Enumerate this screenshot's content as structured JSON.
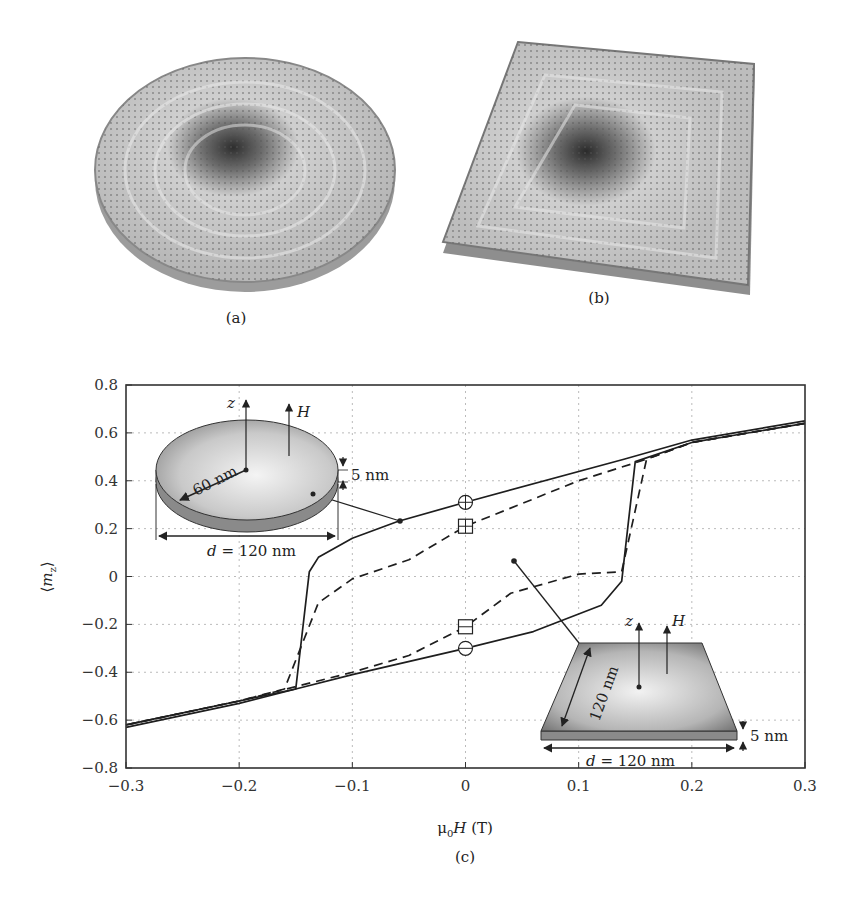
{
  "figure": {
    "panels": [
      {
        "id": "a",
        "label": "(a)",
        "description": "3D vortex magnetization arrows on a circular disk"
      },
      {
        "id": "b",
        "label": "(b)",
        "description": "3D vortex magnetization arrows on a square platelet"
      },
      {
        "id": "c",
        "label": "(c)",
        "description": "Hysteresis loops of <m_z> vs applied field"
      }
    ]
  },
  "chart_data": {
    "type": "line",
    "title": "",
    "panel_label": "(c)",
    "xlabel": "μ0H (T)",
    "ylabel": "⟨m_z⟩",
    "xlim": [
      -0.3,
      0.3
    ],
    "ylim": [
      -0.8,
      0.8
    ],
    "xticks": [
      -0.3,
      -0.2,
      -0.1,
      0,
      0.1,
      0.2,
      0.3
    ],
    "xtick_labels": [
      "−0.3",
      "−0.2",
      "−0.1",
      "0",
      "0.1",
      "0.2",
      "0.3"
    ],
    "yticks": [
      -0.8,
      -0.6,
      -0.4,
      -0.2,
      0,
      0.2,
      0.4,
      0.6,
      0.8
    ],
    "ytick_labels": [
      "−0.8",
      "−0.6",
      "−0.4",
      "−0.2",
      "0",
      "0.2",
      "0.4",
      "0.6",
      "0.8"
    ],
    "grid": true,
    "legend": null,
    "series": [
      {
        "name": "disk (solid)",
        "style": "solid",
        "descending_branch": {
          "x": [
            0.3,
            0.2,
            0.14,
            0.0,
            -0.06,
            -0.1,
            -0.13,
            -0.138,
            -0.15,
            -0.2,
            -0.3
          ],
          "y": [
            0.65,
            0.57,
            0.49,
            0.31,
            0.23,
            0.16,
            0.08,
            0.02,
            -0.47,
            -0.53,
            -0.63
          ]
        },
        "ascending_branch": {
          "x": [
            -0.3,
            -0.2,
            -0.15,
            -0.1,
            0.0,
            0.06,
            0.12,
            0.138,
            0.15,
            0.2,
            0.3
          ],
          "y": [
            -0.62,
            -0.52,
            -0.47,
            -0.41,
            -0.3,
            -0.23,
            -0.12,
            -0.02,
            0.48,
            0.56,
            0.64
          ]
        }
      },
      {
        "name": "square (dashed)",
        "style": "dashed",
        "descending_branch": {
          "x": [
            0.3,
            0.2,
            0.16,
            0.1,
            0.0,
            -0.05,
            -0.1,
            -0.13,
            -0.16,
            -0.2,
            -0.3
          ],
          "y": [
            0.64,
            0.56,
            0.49,
            0.4,
            0.21,
            0.07,
            -0.01,
            -0.11,
            -0.47,
            -0.52,
            -0.62
          ]
        },
        "ascending_branch": {
          "x": [
            -0.3,
            -0.2,
            -0.1,
            -0.05,
            0.0,
            0.04,
            0.1,
            0.138,
            0.16,
            0.2,
            0.3
          ],
          "y": [
            -0.62,
            -0.52,
            -0.4,
            -0.33,
            -0.21,
            -0.07,
            0.01,
            0.02,
            0.49,
            0.56,
            0.64
          ]
        }
      }
    ],
    "markers": [
      {
        "symbol": "circle-plus",
        "x": 0,
        "y": 0.31
      },
      {
        "symbol": "square-plus",
        "x": 0,
        "y": 0.21
      },
      {
        "symbol": "square-minus",
        "x": 0,
        "y": -0.21
      },
      {
        "symbol": "circle-minus",
        "x": 0,
        "y": -0.3
      }
    ],
    "insets": [
      {
        "name": "disk-inset",
        "shape": "disk",
        "labels": {
          "z": "z",
          "H": "H",
          "radius": "60 nm",
          "thickness": "5 nm",
          "diameter_var": "d",
          "diameter": " = 120 nm"
        },
        "points_to": {
          "x": -0.06,
          "y": 0.23
        }
      },
      {
        "name": "square-inset",
        "shape": "square",
        "labels": {
          "z": "z",
          "H": "H",
          "side": "120 nm",
          "thickness": "5 nm",
          "diameter_var": "d",
          "diameter": " = 120 nm"
        },
        "points_to": {
          "x": 0.045,
          "y": -0.06
        }
      }
    ]
  }
}
